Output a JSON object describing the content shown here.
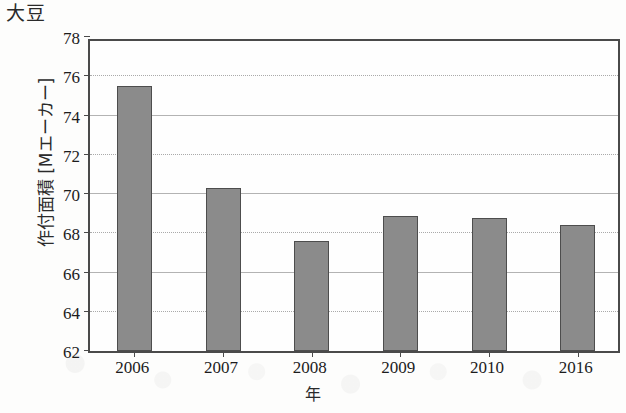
{
  "chart_data": {
    "type": "bar",
    "title": "大豆",
    "xlabel": "年",
    "ylabel": "作付面積 [Mエーカー]",
    "categories": [
      "2006",
      "2007",
      "2008",
      "2009",
      "2010",
      "2016"
    ],
    "values": [
      75.5,
      70.3,
      67.6,
      68.9,
      68.8,
      68.4
    ],
    "ylim": [
      62,
      78
    ],
    "yticks": [
      62,
      64,
      66,
      68,
      70,
      72,
      74,
      76,
      78
    ],
    "grid": true,
    "legend": null,
    "series_color": "#8b8b8b",
    "axis_color": "#4a4a4a",
    "grid_color": "#9a9a9a"
  }
}
